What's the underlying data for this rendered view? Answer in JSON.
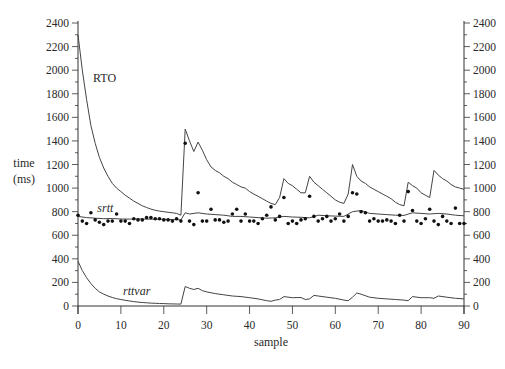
{
  "chart_data": {
    "type": "line",
    "title": "",
    "xlabel": "sample",
    "ylabel": "time (ms)",
    "ylabel_lines": [
      "time",
      "(ms)"
    ],
    "xlim": [
      0,
      90
    ],
    "ylim": [
      0,
      2400
    ],
    "x_ticks": [
      0,
      10,
      20,
      30,
      40,
      50,
      60,
      70,
      80,
      90
    ],
    "y_ticks": [
      0,
      200,
      400,
      600,
      800,
      1000,
      1200,
      1400,
      1600,
      1800,
      2000,
      2200,
      2400
    ],
    "y_minor_step": 100,
    "grid": false,
    "right_axis_mirror": true,
    "series": [
      {
        "name": "RTO",
        "label": "RTO",
        "style": "line",
        "label_pos": {
          "x": 3.5,
          "y": 1900
        },
        "x": [
          0,
          1,
          2,
          3,
          4,
          5,
          6,
          7,
          8,
          9,
          10,
          11,
          12,
          13,
          14,
          15,
          16,
          17,
          18,
          19,
          20,
          21,
          22,
          23,
          24,
          25,
          26,
          27,
          28,
          29,
          30,
          31,
          32,
          33,
          34,
          35,
          36,
          37,
          38,
          39,
          40,
          41,
          42,
          43,
          44,
          45,
          46,
          47,
          48,
          49,
          50,
          51,
          52,
          53,
          54,
          55,
          56,
          57,
          58,
          59,
          60,
          61,
          62,
          63,
          64,
          65,
          66,
          67,
          68,
          69,
          70,
          71,
          72,
          73,
          74,
          75,
          76,
          77,
          78,
          79,
          80,
          81,
          82,
          83,
          84,
          85,
          86,
          87,
          88,
          89,
          90
        ],
        "values": [
          2300,
          2000,
          1750,
          1530,
          1380,
          1260,
          1170,
          1100,
          1040,
          1000,
          970,
          940,
          915,
          890,
          870,
          850,
          835,
          822,
          812,
          805,
          800,
          795,
          790,
          785,
          770,
          1500,
          1400,
          1310,
          1390,
          1320,
          1240,
          1180,
          1150,
          1130,
          1100,
          1080,
          1050,
          1030,
          1010,
          1000,
          970,
          950,
          930,
          910,
          890,
          870,
          860,
          920,
          1080,
          1040,
          1020,
          990,
          960,
          960,
          1100,
          1050,
          1020,
          990,
          960,
          930,
          900,
          880,
          870,
          950,
          1200,
          1100,
          1060,
          1040,
          1010,
          990,
          970,
          950,
          930,
          910,
          880,
          860,
          850,
          1050,
          1020,
          1000,
          960,
          940,
          920,
          1150,
          1110,
          1080,
          1060,
          1030,
          1010,
          1000,
          990
        ]
      },
      {
        "name": "srtt",
        "label": "srtt",
        "style": "line",
        "label_pos": {
          "x": 4.5,
          "y": 800
        },
        "x": [
          0,
          2,
          4,
          6,
          8,
          10,
          12,
          14,
          16,
          18,
          20,
          22,
          24,
          25,
          26,
          28,
          30,
          32,
          34,
          36,
          38,
          40,
          42,
          44,
          46,
          48,
          50,
          52,
          54,
          56,
          58,
          60,
          62,
          64,
          66,
          68,
          70,
          72,
          74,
          76,
          78,
          80,
          82,
          84,
          86,
          88,
          90
        ],
        "values": [
          760,
          750,
          745,
          740,
          742,
          738,
          737,
          738,
          737,
          736,
          735,
          733,
          730,
          790,
          780,
          790,
          780,
          775,
          770,
          760,
          760,
          755,
          750,
          745,
          748,
          760,
          755,
          752,
          748,
          770,
          765,
          762,
          760,
          800,
          810,
          785,
          780,
          775,
          770,
          768,
          790,
          785,
          780,
          785,
          780,
          770,
          765
        ]
      },
      {
        "name": "rttvar",
        "label": "rttvar",
        "style": "line",
        "label_pos": {
          "x": 10.5,
          "y": 90
        },
        "x": [
          0,
          1,
          2,
          3,
          4,
          5,
          6,
          7,
          8,
          9,
          10,
          11,
          12,
          13,
          14,
          15,
          16,
          17,
          18,
          19,
          20,
          21,
          22,
          23,
          24,
          25,
          26,
          27,
          28,
          29,
          30,
          32,
          34,
          36,
          38,
          40,
          42,
          44,
          45,
          46,
          47,
          48,
          50,
          52,
          53,
          54,
          55,
          56,
          58,
          60,
          62,
          63,
          64,
          65,
          66,
          68,
          70,
          72,
          74,
          76,
          77,
          78,
          80,
          82,
          83,
          84,
          86,
          88,
          90
        ],
        "values": [
          380,
          300,
          240,
          190,
          150,
          120,
          100,
          85,
          72,
          62,
          55,
          48,
          42,
          37,
          33,
          30,
          27,
          25,
          23,
          21,
          20,
          19,
          18,
          17,
          16,
          165,
          150,
          140,
          150,
          130,
          120,
          105,
          95,
          85,
          80,
          70,
          60,
          45,
          40,
          50,
          55,
          80,
          70,
          72,
          55,
          60,
          90,
          85,
          75,
          65,
          50,
          45,
          75,
          110,
          100,
          75,
          65,
          60,
          55,
          50,
          45,
          80,
          70,
          70,
          65,
          85,
          75,
          65,
          60
        ]
      },
      {
        "name": "measured RTT",
        "style": "scatter",
        "x": [
          0,
          1,
          2,
          3,
          4,
          5,
          6,
          7,
          8,
          9,
          10,
          11,
          12,
          13,
          14,
          15,
          16,
          17,
          18,
          19,
          20,
          21,
          22,
          23,
          24,
          25,
          26,
          27,
          28,
          29,
          30,
          31,
          32,
          33,
          34,
          35,
          36,
          37,
          38,
          39,
          40,
          41,
          42,
          43,
          44,
          45,
          46,
          47,
          48,
          49,
          50,
          51,
          52,
          53,
          54,
          55,
          56,
          57,
          58,
          59,
          60,
          61,
          62,
          63,
          64,
          65,
          66,
          67,
          68,
          69,
          70,
          71,
          72,
          73,
          74,
          75,
          76,
          77,
          78,
          79,
          80,
          81,
          82,
          83,
          84,
          85,
          86,
          87,
          88,
          89,
          90
        ],
        "values": [
          770,
          720,
          700,
          790,
          730,
          710,
          690,
          720,
          720,
          780,
          720,
          720,
          700,
          740,
          730,
          730,
          750,
          750,
          740,
          740,
          730,
          730,
          720,
          740,
          720,
          1380,
          720,
          690,
          960,
          720,
          720,
          820,
          730,
          730,
          710,
          720,
          780,
          820,
          720,
          780,
          720,
          720,
          700,
          740,
          770,
          840,
          730,
          760,
          920,
          700,
          720,
          700,
          730,
          740,
          930,
          760,
          720,
          740,
          760,
          720,
          740,
          780,
          720,
          760,
          960,
          950,
          800,
          790,
          720,
          740,
          720,
          720,
          730,
          720,
          700,
          770,
          720,
          970,
          810,
          720,
          700,
          740,
          820,
          720,
          690,
          760,
          720,
          700,
          830,
          700,
          700
        ]
      }
    ]
  }
}
